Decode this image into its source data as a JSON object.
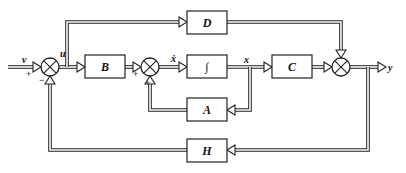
{
  "diagram": {
    "type": "block-diagram",
    "blocks": {
      "B": "B",
      "D": "D",
      "integrator": "∫",
      "C": "C",
      "A": "A",
      "H": "H"
    },
    "signals": {
      "input": "v",
      "u": "u",
      "x_dot": "ẋ",
      "x": "x",
      "output": "y"
    },
    "signs": {
      "sum1_input": "+",
      "sum1_feedback": "−",
      "sum2_input": "+",
      "sum2_feedback": "+"
    },
    "connections": [
      {
        "from": "v",
        "to": "sum1",
        "sign": "+"
      },
      {
        "from": "sum1",
        "to": "B",
        "label": "u"
      },
      {
        "from": "u",
        "to": "D"
      },
      {
        "from": "B",
        "to": "sum2",
        "sign": "+"
      },
      {
        "from": "sum2",
        "to": "integrator",
        "label": "ẋ"
      },
      {
        "from": "integrator",
        "to": "C",
        "label": "x"
      },
      {
        "from": "x",
        "to": "A"
      },
      {
        "from": "A",
        "to": "sum2",
        "sign": "+"
      },
      {
        "from": "C",
        "to": "sum3"
      },
      {
        "from": "D",
        "to": "sum3"
      },
      {
        "from": "sum3",
        "to": "y"
      },
      {
        "from": "y",
        "to": "H"
      },
      {
        "from": "H",
        "to": "sum1",
        "sign": "−"
      }
    ]
  }
}
